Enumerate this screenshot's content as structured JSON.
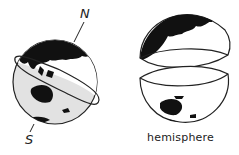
{
  "figure": {
    "type": "illustration",
    "labels": {
      "north": "N",
      "south": "S",
      "caption": "hemisphere"
    },
    "colors": {
      "land": "#111111",
      "ocean_south": "#e2e2e2",
      "ocean_north": "#ffffff",
      "outline": "#222222"
    }
  }
}
